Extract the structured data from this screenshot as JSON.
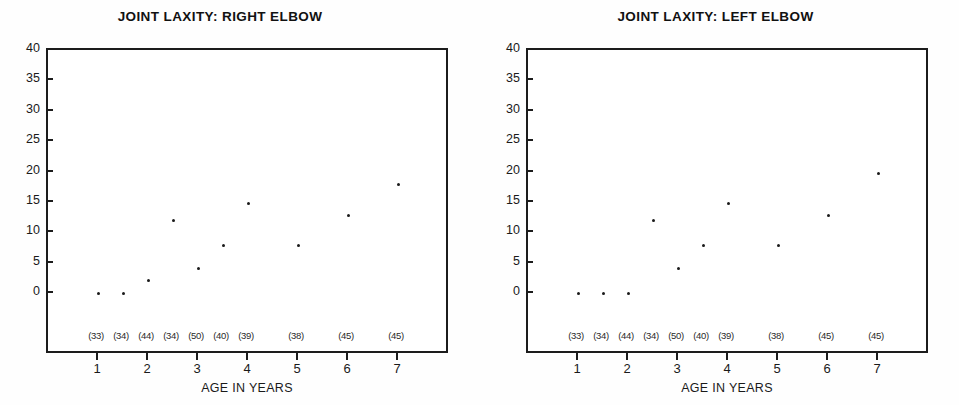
{
  "figure": {
    "background_color": "#fefefe",
    "ink_color": "#1a1a1a"
  },
  "panels": [
    {
      "id": "right-elbow",
      "title": "JOINT LAXITY: RIGHT ELBOW",
      "xlabel": "AGE IN YEARS"
    },
    {
      "id": "left-elbow",
      "title": "JOINT LAXITY: LEFT ELBOW",
      "xlabel": "AGE IN YEARS"
    }
  ],
  "axes": {
    "yticks": [
      40,
      35,
      30,
      25,
      20,
      15,
      10,
      5,
      0
    ],
    "xticks": [
      1,
      2,
      3,
      4,
      5,
      6,
      7
    ],
    "counts": [
      "(33)",
      "(34)",
      "(44)",
      "(34)",
      "(50)",
      "(40)",
      "(39)",
      "(38)",
      "(45)",
      "(45)"
    ]
  },
  "chart_data": [
    {
      "type": "scatter",
      "title": "JOINT LAXITY: RIGHT ELBOW",
      "xlabel": "AGE IN YEARS",
      "ylabel": "",
      "xlim": [
        0.0,
        8.0
      ],
      "ylim": [
        -8.0,
        40.0
      ],
      "grid": false,
      "legend": "none",
      "yticks": [
        0,
        5,
        10,
        15,
        20,
        25,
        30,
        35,
        40
      ],
      "xticks": [
        1,
        2,
        3,
        4,
        5,
        6,
        7
      ],
      "x": [
        1.0,
        1.5,
        2.0,
        2.5,
        3.0,
        3.5,
        4.0,
        5.0,
        6.0,
        7.0
      ],
      "y": [
        0.0,
        0.0,
        2.0,
        12.0,
        4.0,
        7.8,
        14.8,
        7.8,
        12.8,
        17.8
      ],
      "point_counts": [
        33,
        34,
        44,
        34,
        50,
        40,
        39,
        38,
        45,
        45
      ],
      "annotations": [
        "(33)",
        "(34)",
        "(44)",
        "(34)",
        "(50)",
        "(40)",
        "(39)",
        "(38)",
        "(45)",
        "(45)"
      ]
    },
    {
      "type": "scatter",
      "title": "JOINT LAXITY: LEFT ELBOW",
      "xlabel": "AGE IN YEARS",
      "ylabel": "",
      "xlim": [
        0.0,
        8.0
      ],
      "ylim": [
        -8.0,
        40.0
      ],
      "grid": false,
      "legend": "none",
      "yticks": [
        0,
        5,
        10,
        15,
        20,
        25,
        30,
        35,
        40
      ],
      "xticks": [
        1,
        2,
        3,
        4,
        5,
        6,
        7
      ],
      "x": [
        1.0,
        1.5,
        2.0,
        2.5,
        3.0,
        3.5,
        4.0,
        5.0,
        6.0,
        7.0
      ],
      "y": [
        0.0,
        0.0,
        0.0,
        12.0,
        4.0,
        7.8,
        14.8,
        7.8,
        12.8,
        19.6
      ],
      "point_counts": [
        33,
        34,
        44,
        34,
        50,
        40,
        39,
        38,
        45,
        45
      ],
      "annotations": [
        "(33)",
        "(34)",
        "(44)",
        "(34)",
        "(50)",
        "(40)",
        "(39)",
        "(38)",
        "(45)",
        "(45)"
      ]
    }
  ]
}
